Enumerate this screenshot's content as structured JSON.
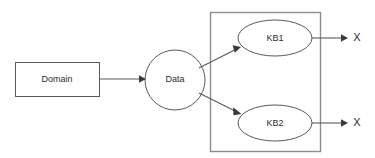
{
  "diagram": {
    "background_color": "#ffffff",
    "stroke_color": "#59595b",
    "container_stroke_color": "#8d8d90",
    "label_color": "#2b2b2d",
    "nodes": [
      {
        "id": "domain",
        "label": "Domain",
        "shape": "rectangle",
        "x": 15,
        "y": 62,
        "width": 84,
        "height": 34,
        "center_x": 57,
        "center_y": 79
      },
      {
        "id": "data",
        "label": "Data",
        "shape": "circle",
        "center_x": 175,
        "center_y": 80,
        "radius": 30
      },
      {
        "id": "kb1",
        "label": "KB1",
        "shape": "ellipse",
        "center_x": 275,
        "center_y": 38,
        "rx": 37,
        "ry": 18
      },
      {
        "id": "kb2",
        "label": "KB2",
        "shape": "ellipse",
        "center_x": 275,
        "center_y": 123,
        "rx": 37,
        "ry": 18
      }
    ],
    "container": {
      "id": "kb-group",
      "label": "",
      "shape": "rectangle",
      "x": 210,
      "y": 12,
      "width": 110,
      "height": 139
    },
    "terminals": [
      {
        "id": "output-top",
        "label": "X",
        "x": 356,
        "y": 38
      },
      {
        "id": "output-bottom",
        "label": "X",
        "x": 356,
        "y": 123
      }
    ],
    "edges": [
      {
        "id": "domain-to-data",
        "from": "domain",
        "to": "data",
        "type": "arrow",
        "x1": 99,
        "y1": 79,
        "x2": 144,
        "y2": 79
      },
      {
        "id": "data-to-kb1",
        "from": "data",
        "to": "kb1",
        "type": "arrow",
        "x1": 199,
        "y1": 67,
        "x2": 240,
        "y2": 47
      },
      {
        "id": "data-to-kb2",
        "from": "data",
        "to": "kb2",
        "type": "arrow",
        "x1": 199,
        "y1": 94,
        "x2": 241,
        "y2": 114
      },
      {
        "id": "kb1-to-output",
        "from": "kb1",
        "to": "output-top",
        "type": "arrow",
        "x1": 312,
        "y1": 38,
        "x2": 347,
        "y2": 38
      },
      {
        "id": "kb2-to-output",
        "from": "kb2",
        "to": "output-bottom",
        "type": "arrow",
        "x1": 312,
        "y1": 123,
        "x2": 347,
        "y2": 123
      }
    ]
  }
}
